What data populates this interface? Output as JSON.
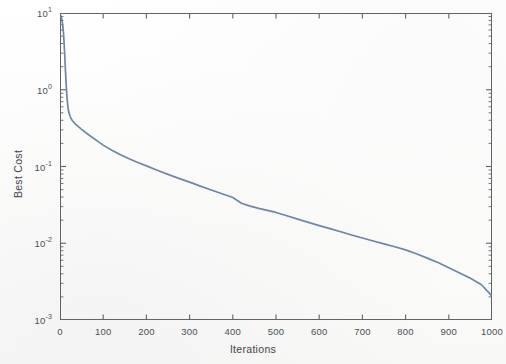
{
  "chart_data": {
    "type": "line",
    "title": "",
    "xlabel": "Iterations",
    "ylabel": "Best Cost",
    "xlim": [
      0,
      1000
    ],
    "ylim": [
      0.001,
      10
    ],
    "yscale": "log",
    "xscale": "linear",
    "grid": false,
    "legend": null,
    "box": true,
    "minor_ticks": "log-minor on y, none on x",
    "line_color": "#5b7fa6",
    "xticks": [
      0,
      100,
      200,
      300,
      400,
      500,
      600,
      700,
      800,
      900,
      1000
    ],
    "xticklabels": [
      "0",
      "100",
      "200",
      "300",
      "400",
      "500",
      "600",
      "700",
      "800",
      "900",
      "1000"
    ],
    "yticks": [
      10,
      1,
      0.1,
      0.01,
      0.001
    ],
    "yticklabels": [
      "10",
      "10",
      "10",
      "10",
      "10"
    ],
    "yticklabel_exponents": [
      "1",
      "0",
      "-1",
      "-2",
      "-3"
    ],
    "series": [
      {
        "name": "Best Cost",
        "x": [
          0,
          2,
          4,
          6,
          8,
          10,
          12,
          14,
          16,
          18,
          20,
          24,
          28,
          32,
          36,
          40,
          50,
          60,
          70,
          80,
          90,
          100,
          120,
          140,
          160,
          180,
          200,
          225,
          250,
          275,
          300,
          325,
          350,
          375,
          400,
          420,
          440,
          460,
          480,
          500,
          525,
          550,
          575,
          600,
          625,
          650,
          675,
          700,
          725,
          750,
          775,
          800,
          825,
          850,
          875,
          900,
          925,
          950,
          975,
          1000
        ],
        "y": [
          9.6,
          9.2,
          8.4,
          7.2,
          5.6,
          3.6,
          2.1,
          1.25,
          0.82,
          0.62,
          0.52,
          0.44,
          0.4,
          0.375,
          0.355,
          0.34,
          0.305,
          0.275,
          0.25,
          0.228,
          0.208,
          0.19,
          0.163,
          0.142,
          0.126,
          0.113,
          0.102,
          0.0895,
          0.079,
          0.07,
          0.0625,
          0.0555,
          0.0495,
          0.0442,
          0.0395,
          0.0332,
          0.0305,
          0.0285,
          0.0268,
          0.0252,
          0.0228,
          0.0206,
          0.0187,
          0.017,
          0.0155,
          0.0141,
          0.0128,
          0.0117,
          0.0107,
          0.0098,
          0.009,
          0.0082,
          0.0073,
          0.0064,
          0.0056,
          0.0048,
          0.0041,
          0.0035,
          0.0029,
          0.00205
        ]
      }
    ]
  }
}
